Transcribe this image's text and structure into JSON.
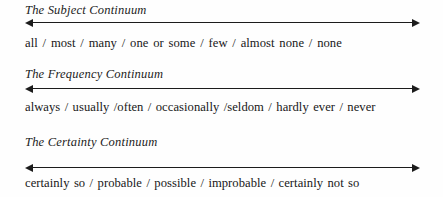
{
  "page": {
    "background_color": "#fefefe",
    "text_color": "#1a1a1a",
    "line_color": "#1c1c1c"
  },
  "blocks": [
    {
      "id": "subject",
      "title": "The Subject Continuum",
      "axis": {
        "left_arrow": "arrow-left",
        "right_arrow": "arrow-right"
      },
      "line": "all  /  most  /  many  /  one or some  /  few  /  almost none  /  none",
      "terms": [
        "all",
        "most",
        "many",
        "one or some",
        "few",
        "almost none",
        "none"
      ],
      "separators": [
        "  /  ",
        "  /  ",
        "  /  ",
        "  /  ",
        "  /  ",
        "  /  "
      ]
    },
    {
      "id": "frequency",
      "title": "The Frequency Continuum",
      "axis": {
        "left_arrow": "arrow-left",
        "right_arrow": "arrow-right"
      },
      "line": "always  /  usually  /often  /  occasionally  /seldom  /  hardly ever  /  never",
      "terms": [
        "always",
        "usually",
        "often",
        "occasionally",
        "seldom",
        "hardly ever",
        "never"
      ],
      "separators": [
        "  /  ",
        "  /",
        "  /  ",
        "  /",
        "  /  ",
        "  /  "
      ]
    },
    {
      "id": "certainty",
      "title": "The Certainty Continuum",
      "axis": {
        "left_arrow": "arrow-left",
        "right_arrow": "arrow-right"
      },
      "line": "certainly so  /  probable  /  possible  /  improbable  /  certainly not so",
      "terms": [
        "certainly so",
        "probable",
        "possible",
        "improbable",
        "certainly not so"
      ],
      "separators": [
        "  /  ",
        "  /  ",
        "  /  ",
        "  /  "
      ]
    }
  ]
}
